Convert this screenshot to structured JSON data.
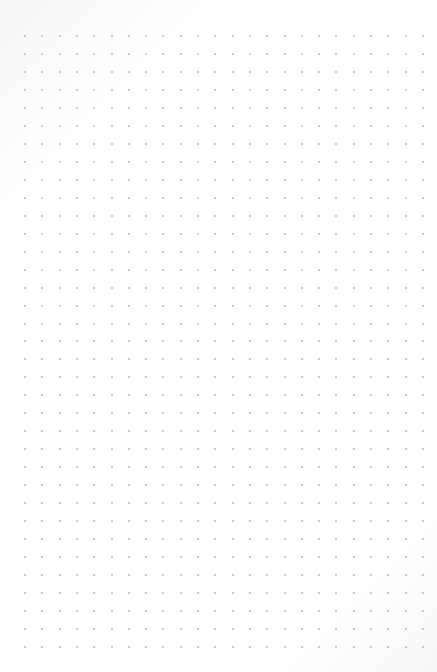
{
  "page": {
    "type": "dot-grid-paper",
    "background_color": "#ffffff",
    "dot_color": "#b9b9b9"
  },
  "grid": {
    "columns": 24,
    "rows": 35,
    "origin_x": 25,
    "origin_y": 36,
    "spacing_x": 17.3,
    "spacing_y": 17.97,
    "dot_size": 2
  }
}
